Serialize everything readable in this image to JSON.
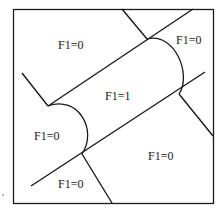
{
  "diagram": {
    "type": "region-partition",
    "colors": {
      "line": "#1a1a1a",
      "background": "#ffffff"
    },
    "regions": [
      {
        "id": "top-left",
        "label": "F1=0"
      },
      {
        "id": "top-right",
        "label": "F1=0"
      },
      {
        "id": "center-band",
        "label": "F1=1"
      },
      {
        "id": "left-cap",
        "label": "F1=0"
      },
      {
        "id": "bottom-right",
        "label": "F1=0"
      },
      {
        "id": "bottom-middle",
        "label": "F1=0"
      }
    ]
  }
}
